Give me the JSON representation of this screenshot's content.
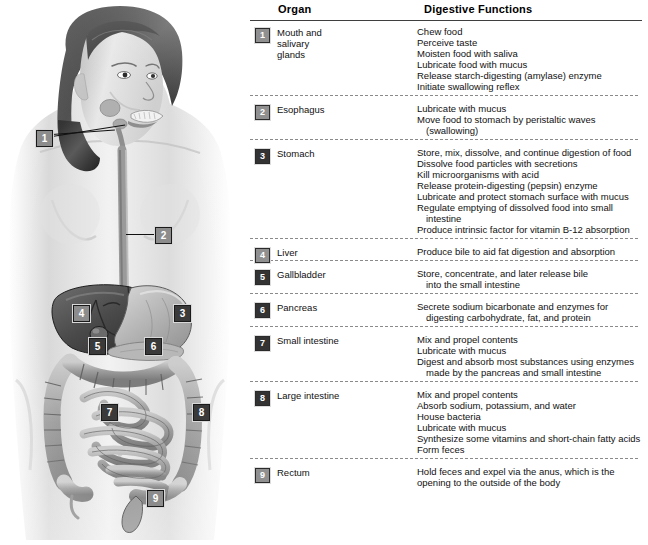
{
  "figure": {
    "callouts": [
      {
        "id": "1",
        "number": "1",
        "x": 36,
        "y": 130,
        "tone": "light"
      },
      {
        "id": "2",
        "number": "2",
        "x": 155,
        "y": 227,
        "tone": "light"
      },
      {
        "id": "3",
        "number": "3",
        "x": 174,
        "y": 305,
        "tone": "dark"
      },
      {
        "id": "4",
        "number": "4",
        "x": 73,
        "y": 305,
        "tone": "light"
      },
      {
        "id": "5",
        "number": "5",
        "x": 89,
        "y": 338,
        "tone": "dark"
      },
      {
        "id": "6",
        "number": "6",
        "x": 145,
        "y": 338,
        "tone": "dark"
      },
      {
        "id": "7",
        "number": "7",
        "x": 101,
        "y": 404,
        "tone": "dark"
      },
      {
        "id": "8",
        "number": "8",
        "x": 193,
        "y": 404,
        "tone": "dark"
      },
      {
        "id": "9",
        "number": "9",
        "x": 147,
        "y": 490,
        "tone": "light"
      }
    ]
  },
  "table": {
    "headers": {
      "organ": "Organ",
      "functions": "Digestive Functions"
    },
    "rows": [
      {
        "number": "1",
        "tone": "light",
        "organ": "Mouth and\nsalivary\nglands",
        "functions": [
          {
            "text": "Chew food",
            "cont": false
          },
          {
            "text": "Perceive taste",
            "cont": false
          },
          {
            "text": "Moisten food with saliva",
            "cont": false
          },
          {
            "text": "Lubricate food with mucus",
            "cont": false
          },
          {
            "text": "Release starch-digesting (amylase) enzyme",
            "cont": false
          },
          {
            "text": "Initiate swallowing reflex",
            "cont": false
          }
        ]
      },
      {
        "number": "2",
        "tone": "light",
        "organ": "Esophagus",
        "functions": [
          {
            "text": "Lubricate with mucus",
            "cont": false
          },
          {
            "text": "Move food to stomach by peristaltic waves",
            "cont": false
          },
          {
            "text": "(swallowing)",
            "cont": true
          }
        ]
      },
      {
        "number": "3",
        "tone": "dark",
        "organ": "Stomach",
        "functions": [
          {
            "text": "Store, mix, dissolve, and continue digestion of food",
            "cont": false
          },
          {
            "text": "Dissolve food particles with secretions",
            "cont": false
          },
          {
            "text": "Kill microorganisms with acid",
            "cont": false
          },
          {
            "text": "Release protein-digesting (pepsin) enzyme",
            "cont": false
          },
          {
            "text": "Lubricate and protect stomach surface with mucus",
            "cont": false
          },
          {
            "text": "Regulate emptying of dissolved food into small",
            "cont": false
          },
          {
            "text": "intestine",
            "cont": true
          },
          {
            "text": "Produce intrinsic factor for vitamin B-12 absorption",
            "cont": false
          }
        ]
      },
      {
        "number": "4",
        "tone": "light",
        "organ": "Liver",
        "functions": [
          {
            "text": "Produce bile to aid fat digestion and absorption",
            "cont": false
          }
        ]
      },
      {
        "number": "5",
        "tone": "dark",
        "organ": "Gallbladder",
        "functions": [
          {
            "text": "Store, concentrate, and later release bile",
            "cont": false
          },
          {
            "text": "into the small intestine",
            "cont": true
          }
        ]
      },
      {
        "number": "6",
        "tone": "dark",
        "organ": "Pancreas",
        "functions": [
          {
            "text": "Secrete sodium bicarbonate and enzymes for",
            "cont": false
          },
          {
            "text": "digesting carbohydrate, fat, and protein",
            "cont": true
          }
        ]
      },
      {
        "number": "7",
        "tone": "dark",
        "organ": "Small intestine",
        "functions": [
          {
            "text": "Mix and propel contents",
            "cont": false
          },
          {
            "text": "Lubricate with mucus",
            "cont": false
          },
          {
            "text": "Digest and absorb most substances using enzymes",
            "cont": false
          },
          {
            "text": "made by the pancreas and small intestine",
            "cont": true
          }
        ]
      },
      {
        "number": "8",
        "tone": "dark",
        "organ": "Large intestine",
        "functions": [
          {
            "text": "Mix and propel contents",
            "cont": false
          },
          {
            "text": "Absorb sodium, potassium, and water",
            "cont": false
          },
          {
            "text": "House bacteria",
            "cont": false
          },
          {
            "text": "Lubricate with mucus",
            "cont": false
          },
          {
            "text": "Synthesize some vitamins and short-chain fatty acids",
            "cont": false
          },
          {
            "text": "Form feces",
            "cont": false
          }
        ]
      },
      {
        "number": "9",
        "tone": "light",
        "organ": "Rectum",
        "functions": [
          {
            "text": "Hold feces and expel via the anus, which is the",
            "cont": false
          },
          {
            "text": "opening to the outside of the body",
            "cont": false
          }
        ]
      }
    ]
  },
  "colors": {
    "badge_dark": "#333333",
    "badge_light": "#909090",
    "rule": "#3f3f3f",
    "dashed": "#8a8a8a",
    "background": "#ffffff"
  }
}
